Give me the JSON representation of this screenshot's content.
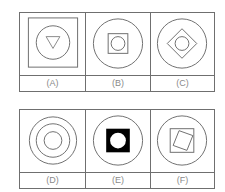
{
  "diagram": {
    "rows": [
      {
        "options": [
          {
            "label": "(A)",
            "description": "square frame containing circle containing downward triangle"
          },
          {
            "label": "(B)",
            "description": "circle containing square containing circle"
          },
          {
            "label": "(C)",
            "description": "circle containing diamond containing circle"
          }
        ]
      },
      {
        "options": [
          {
            "label": "(D)",
            "description": "three concentric circles"
          },
          {
            "label": "(E)",
            "description": "circle containing filled black square with white circle"
          },
          {
            "label": "(F)",
            "description": "circle containing square containing rotated square"
          }
        ]
      }
    ],
    "colors": {
      "stroke": "#6f6f6f",
      "fill": "#000000",
      "label": "#8a8a8a"
    }
  }
}
